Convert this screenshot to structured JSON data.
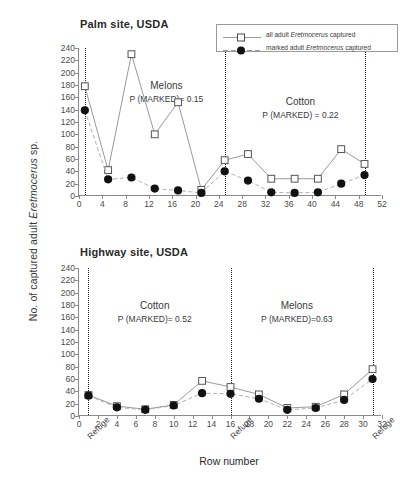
{
  "figure": {
    "y_axis_title_prefix": "No. of captured adult ",
    "y_axis_title_italic": "Eretmocerus",
    "y_axis_title_suffix": " sp.",
    "x_axis_title": "Row number",
    "refuge_label": "Refuge"
  },
  "legend": {
    "position": "top-right",
    "items": [
      {
        "marker": "open-square",
        "line": "solid",
        "prefix": "all adult ",
        "italic": "Eretmocerus",
        "suffix": " captured"
      },
      {
        "marker": "filled-circle",
        "line": "dashed",
        "prefix": "marked adult ",
        "italic": "Eretmocerus",
        "suffix": " captured"
      }
    ]
  },
  "chart_data": [
    {
      "type": "line",
      "title": "Palm site, USDA",
      "xlabel": "Row number",
      "ylabel": "No. of captured adult Eretmocerus sp.",
      "xlim": [
        0,
        52
      ],
      "ylim": [
        0,
        240
      ],
      "xticks": [
        0,
        4,
        8,
        12,
        16,
        20,
        24,
        28,
        32,
        36,
        40,
        44,
        48,
        52
      ],
      "yticks": [
        0,
        20,
        40,
        60,
        80,
        100,
        120,
        140,
        160,
        180,
        200,
        220,
        240
      ],
      "grid": false,
      "refuge_lines": [
        1,
        25,
        49
      ],
      "refuge_labels": [],
      "annotations": [
        {
          "crop": "Melons",
          "pvalue": "P (MARKED)= 0.15",
          "x": 15,
          "y": 175
        },
        {
          "crop": "Cotton",
          "pvalue": "P (MARKED) = 0.22",
          "x": 38,
          "y": 150
        }
      ],
      "series": [
        {
          "name": "all adult Eretmocerus captured",
          "marker": "open-square",
          "line": "solid",
          "x": [
            1,
            5,
            9,
            13,
            17,
            21,
            25,
            29,
            33,
            37,
            41,
            45,
            49
          ],
          "values": [
            178,
            42,
            230,
            100,
            152,
            10,
            58,
            68,
            28,
            28,
            28,
            76,
            52
          ]
        },
        {
          "name": "marked adult Eretmocerus captured",
          "marker": "filled-circle",
          "line": "dashed",
          "x": [
            1,
            5,
            9,
            13,
            17,
            21,
            25,
            29,
            33,
            37,
            41,
            45,
            49
          ],
          "values": [
            139,
            27,
            30,
            12,
            9,
            5,
            40,
            25,
            6,
            5,
            6,
            20,
            34
          ]
        }
      ]
    },
    {
      "type": "line",
      "title": "Highway site, USDA",
      "xlabel": "Row number",
      "ylabel": "No. of captured adult Eretmocerus sp.",
      "xlim": [
        0,
        32
      ],
      "ylim": [
        0,
        240
      ],
      "xticks": [
        0,
        2,
        4,
        6,
        8,
        10,
        12,
        14,
        16,
        18,
        20,
        22,
        24,
        26,
        28,
        30,
        32
      ],
      "yticks": [
        0,
        20,
        40,
        60,
        80,
        100,
        120,
        140,
        160,
        180,
        200,
        220,
        240
      ],
      "grid": false,
      "refuge_lines": [
        1,
        16,
        31
      ],
      "refuge_labels": [
        "Refuge",
        "Refuge",
        "Refuge"
      ],
      "annotations": [
        {
          "crop": "Cotton",
          "pvalue": "P (MARKED)= 0.52",
          "x": 8,
          "y": 175
        },
        {
          "crop": "Melons",
          "pvalue": "P (MARKED)=0.63",
          "x": 23,
          "y": 175
        }
      ],
      "series": [
        {
          "name": "all adult Eretmocerus captured",
          "marker": "open-square",
          "line": "solid",
          "x": [
            1,
            4,
            7,
            10,
            13,
            16,
            19,
            22,
            25,
            28,
            31
          ],
          "values": [
            34,
            16,
            11,
            18,
            57,
            47,
            35,
            13,
            15,
            35,
            76
          ]
        },
        {
          "name": "marked adult Eretmocerus captured",
          "marker": "filled-circle",
          "line": "dashed",
          "x": [
            1,
            4,
            7,
            10,
            13,
            16,
            19,
            22,
            25,
            28,
            31
          ],
          "values": [
            33,
            14,
            10,
            17,
            37,
            36,
            28,
            10,
            13,
            26,
            60
          ]
        }
      ]
    }
  ]
}
